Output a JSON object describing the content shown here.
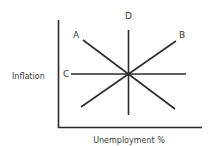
{
  "diagram": {
    "ylabel": "Inflation",
    "xlabel": "Unemployment %",
    "lines": [
      {
        "label": "A",
        "description": "downward sloping line from upper-left to lower-right"
      },
      {
        "label": "B",
        "description": "upward sloping line from lower-left to upper-right"
      },
      {
        "label": "C",
        "description": "horizontal line"
      },
      {
        "label": "D",
        "description": "vertical line"
      }
    ],
    "line_color": "#2b2b2b",
    "axis_color": "#2b2b2b"
  }
}
